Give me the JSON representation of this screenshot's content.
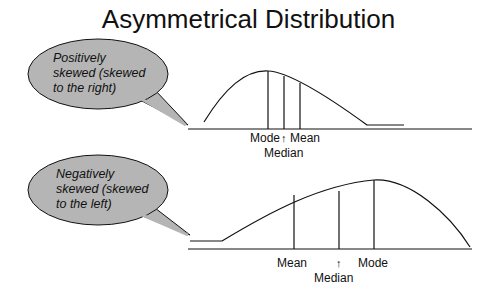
{
  "title": "Asymmetrical Distribution",
  "colors": {
    "bubble_fill": "#b5b5b5",
    "line": "#111111",
    "background": "#ffffff"
  },
  "top": {
    "callout": [
      "Positively",
      "skewed (skewed",
      "to the right)"
    ],
    "labels": {
      "mode": "Mode",
      "arrow": "↑",
      "mean": "Mean",
      "median": "Median"
    }
  },
  "bottom": {
    "callout": [
      "Negatively",
      "skewed (skewed",
      "to the left)"
    ],
    "labels": {
      "mean": "Mean",
      "arrow": "↑",
      "mode": "Mode",
      "median": "Median"
    }
  }
}
